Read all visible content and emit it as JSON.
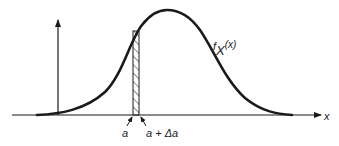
{
  "diagram": {
    "curve_label": {
      "main": "f",
      "subscript": "X",
      "arg": "(x)"
    },
    "x_axis_label": "x",
    "strip_labels": {
      "left": "a",
      "right": "a + Δa"
    },
    "colors": {
      "stroke": "#1a1a1a",
      "background": "#ffffff"
    }
  }
}
